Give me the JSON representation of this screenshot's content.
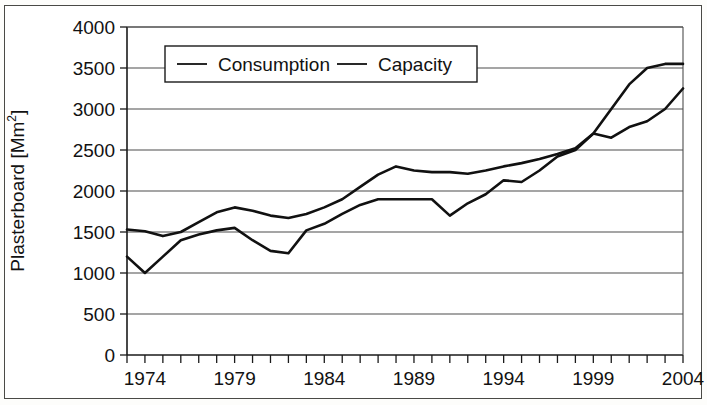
{
  "chart_data": {
    "type": "line",
    "title": "",
    "xlabel": "",
    "ylabel": "Plasterboard [Mm2]",
    "ylabel_text": "Plasterboard [Mm",
    "ylabel_sup": "2",
    "ylabel_suffix": "]",
    "xlim": [
      1973,
      2004
    ],
    "ylim": [
      0,
      4000
    ],
    "grid": true,
    "legend_position": "top-center-left",
    "y_ticks": [
      0,
      500,
      1000,
      1500,
      2000,
      2500,
      3000,
      3500,
      4000
    ],
    "y_tick_labels": [
      "0",
      "500",
      "1000",
      "1500",
      "2000",
      "2500",
      "3000",
      "3500",
      "4000"
    ],
    "x_tick_labels": [
      "1974",
      "1979",
      "1984",
      "1989",
      "1994",
      "1999",
      "2004"
    ],
    "x_tick_label_values": [
      1974,
      1979,
      1984,
      1989,
      1994,
      1999,
      2004
    ],
    "x_minor_ticks": [
      1973,
      1974,
      1975,
      1976,
      1977,
      1978,
      1979,
      1980,
      1981,
      1982,
      1983,
      1984,
      1985,
      1986,
      1987,
      1988,
      1989,
      1990,
      1991,
      1992,
      1993,
      1994,
      1995,
      1996,
      1997,
      1998,
      1999,
      2000,
      2001,
      2002,
      2003,
      2004
    ],
    "x": [
      1973,
      1974,
      1975,
      1976,
      1977,
      1978,
      1979,
      1980,
      1981,
      1982,
      1983,
      1984,
      1985,
      1986,
      1987,
      1988,
      1989,
      1990,
      1991,
      1992,
      1993,
      1994,
      1995,
      1996,
      1997,
      1998,
      1999,
      2000,
      2001,
      2002,
      2003,
      2004
    ],
    "series": [
      {
        "name": "Consumption",
        "color": "#111111",
        "values": [
          1200,
          1000,
          1200,
          1400,
          1470,
          1520,
          1550,
          1400,
          1270,
          1240,
          1520,
          1600,
          1720,
          1830,
          1900,
          1900,
          1900,
          1900,
          1700,
          1850,
          1960,
          2130,
          2110,
          2250,
          2420,
          2500,
          2700,
          2650,
          2780,
          2850,
          3000,
          3250
        ]
      },
      {
        "name": "Capacity",
        "color": "#111111",
        "values": [
          1530,
          1510,
          1450,
          1500,
          1620,
          1740,
          1800,
          1760,
          1700,
          1670,
          1720,
          1800,
          1900,
          2050,
          2200,
          2300,
          2250,
          2230,
          2230,
          2210,
          2250,
          2300,
          2340,
          2390,
          2450,
          2520,
          2700,
          3000,
          3300,
          3500,
          3550,
          3550
        ]
      }
    ],
    "legend": [
      {
        "label": "Consumption"
      },
      {
        "label": "Capacity"
      }
    ]
  }
}
